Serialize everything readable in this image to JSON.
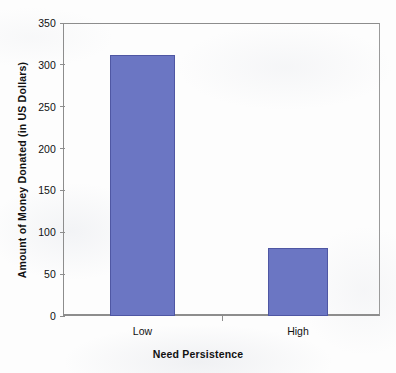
{
  "chart_data": {
    "type": "bar",
    "title": "",
    "subtitle": "",
    "categories": [
      "Low",
      "High"
    ],
    "values": [
      312,
      81
    ],
    "xlabel": "Need Persistence",
    "ylabel": "Amount of Money Donated (in US Dollars)",
    "ylim": [
      0,
      350
    ],
    "yticks": [
      0,
      50,
      100,
      150,
      200,
      250,
      300,
      350
    ],
    "ytick_labels": [
      "0",
      "50",
      "100",
      "150",
      "200",
      "250",
      "300",
      "350"
    ],
    "grid": false,
    "legend": false,
    "legend_position": "none",
    "bar_color": "#6B76C3",
    "bar_edge_color": "#4F57A3",
    "axis_color": "#8D8D8D",
    "background_color": "#FDFDFD",
    "series": [
      {
        "name": "Amount of Money Donated (in US Dollars)",
        "values": [
          312,
          81
        ]
      }
    ],
    "annotations": []
  }
}
